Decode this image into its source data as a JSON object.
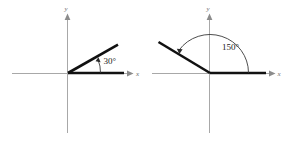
{
  "figure": {
    "background_color": "#ffffff",
    "width": 283,
    "height": 141
  },
  "colors": {
    "axis": "#a8a8a8",
    "axis_label": "#6e6e6e",
    "ray": "#111111",
    "arc": "#3a3a3a",
    "angle_text": "#1a1a1a"
  },
  "diagrams": [
    {
      "id": "left",
      "angle_value": "30",
      "angle_label": "30°",
      "x_axis_label": "x",
      "y_axis_label": "y",
      "origin": {
        "x": 68,
        "y": 73
      },
      "terminal_ray_end": {
        "x": 118,
        "y": 45
      },
      "initial_ray_end": {
        "x": 124,
        "y": 73
      },
      "rotation_direction": "counterclockwise"
    },
    {
      "id": "right",
      "angle_value": "150",
      "angle_label": "150°",
      "x_axis_label": "x",
      "y_axis_label": "y",
      "origin": {
        "x": 210,
        "y": 73
      },
      "terminal_ray_end": {
        "x": 159,
        "y": 42
      },
      "initial_ray_end": {
        "x": 266,
        "y": 73
      },
      "rotation_direction": "counterclockwise"
    }
  ]
}
